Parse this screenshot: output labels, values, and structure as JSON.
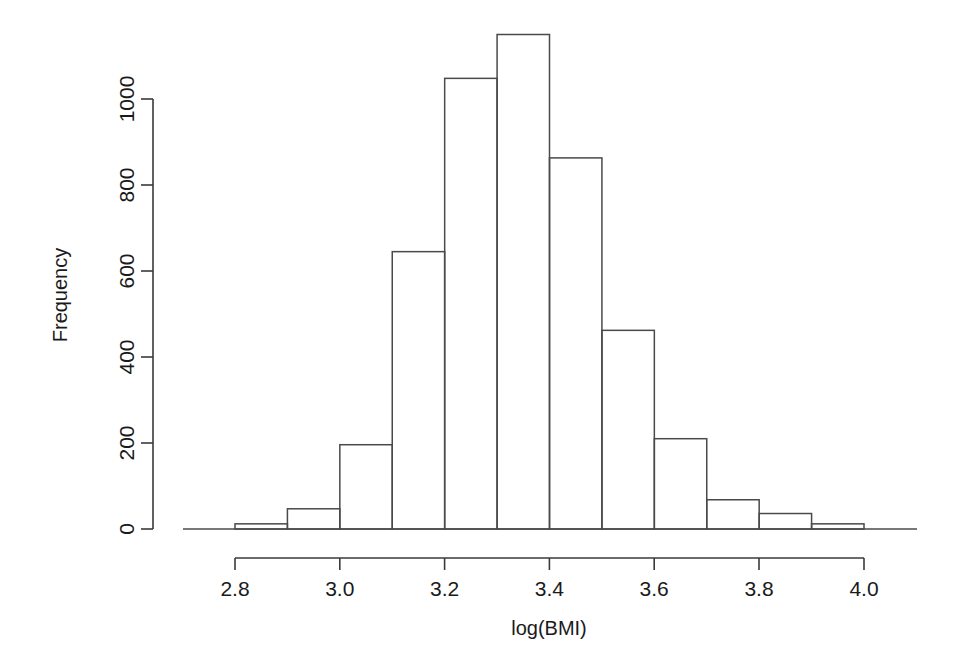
{
  "figure": {
    "background_color": "#ffffff",
    "line_color": "#4a4a4a",
    "text_color": "#1a1a1a"
  },
  "chart_data": {
    "type": "bar",
    "title": "",
    "subtitle": "",
    "xlabel": "log(BMI)",
    "ylabel": "Frequency",
    "grid": false,
    "legend": null,
    "bin_width": 0.1,
    "bin_edges": [
      2.8,
      2.9,
      3.0,
      3.1,
      3.2,
      3.3,
      3.4,
      3.5,
      3.6,
      3.7,
      3.8,
      3.9,
      4.0
    ],
    "categories": [
      "2.8-2.9",
      "2.9-3.0",
      "3.0-3.1",
      "3.1-3.2",
      "3.2-3.3",
      "3.3-3.4",
      "3.4-3.5",
      "3.5-3.6",
      "3.6-3.7",
      "3.7-3.8",
      "3.8-3.9",
      "3.9-4.0"
    ],
    "values": [
      12,
      47,
      196,
      645,
      1048,
      1150,
      863,
      462,
      210,
      68,
      36,
      12
    ],
    "xlim": [
      2.72,
      4.08
    ],
    "ylim": [
      0,
      1150
    ],
    "xticks": [
      2.8,
      3.0,
      3.2,
      3.4,
      3.6,
      3.8,
      4.0
    ],
    "xtick_labels": [
      "2.8",
      "3.0",
      "3.2",
      "3.4",
      "3.6",
      "3.8",
      "4.0"
    ],
    "yticks": [
      0,
      200,
      400,
      600,
      800,
      1000
    ],
    "ytick_labels": [
      "0",
      "200",
      "400",
      "600",
      "800",
      "1000"
    ]
  }
}
